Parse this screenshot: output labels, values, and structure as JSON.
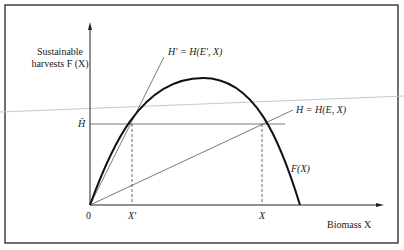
{
  "figure": {
    "y_axis_label_line1": "Sustainable",
    "y_axis_label_line2": "harvests F (X)",
    "x_axis_label": "Biomass X",
    "origin_label": "0",
    "hbar_label": "H̄",
    "x_prime_label": "X′",
    "x_label": "X",
    "curve_label": "F(X)",
    "h_prime_line_label": "H′ = H(E′, X)",
    "h_line_label": "H = H(E, X)"
  },
  "colors": {
    "frame": "#333333",
    "curve": "#111111",
    "thin_line": "#555555",
    "artifact": "#c8c8c8"
  }
}
